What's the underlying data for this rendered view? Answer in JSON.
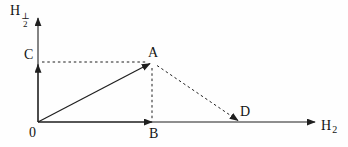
{
  "diagram": {
    "background": "#fefefe",
    "line_color": "#1f1f1f",
    "y_axis_label": {
      "base": "H",
      "sub": "2",
      "sup": "⊥"
    },
    "x_axis_label": {
      "base": "H",
      "sub": "2"
    },
    "labels": {
      "origin": "0",
      "A": "A",
      "B": "B",
      "C": "C",
      "D": "D"
    }
  }
}
